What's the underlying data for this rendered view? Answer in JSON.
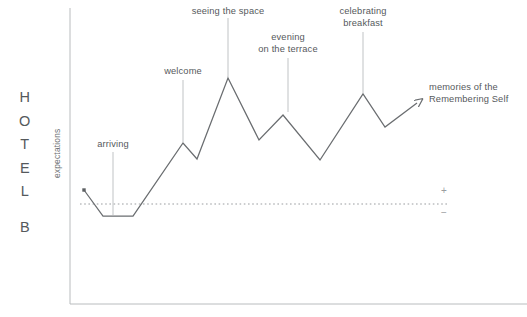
{
  "brand": {
    "name_top": "HOTEL",
    "name_bottom": "B",
    "letters": [
      "H",
      "O",
      "T",
      "E",
      "L"
    ],
    "second_word": "B"
  },
  "axes": {
    "y_label": "expectations",
    "positive_marker": "+",
    "negative_marker": "−"
  },
  "annotations": [
    {
      "id": "arriving",
      "label": "arriving"
    },
    {
      "id": "welcome",
      "label": "welcome"
    },
    {
      "id": "seeing-the-space",
      "label": "seeing the space"
    },
    {
      "id": "evening-on-the-terrace-1",
      "label": "evening"
    },
    {
      "id": "evening-on-the-terrace-2",
      "label": "on the terrace"
    },
    {
      "id": "celebrating-1",
      "label": "celebrating"
    },
    {
      "id": "celebrating-2",
      "label": "breakfast"
    },
    {
      "id": "memories-1",
      "label": "memories of the"
    },
    {
      "id": "memories-2",
      "label": "Remembering Self"
    }
  ],
  "colors": {
    "line": "#6a6d70",
    "axis": "#b9bcbe",
    "baseline": "#9a9da0",
    "text": "#56595c",
    "brand_text": "#55595c",
    "background": "#ffffff"
  },
  "chart_data": {
    "type": "line",
    "title": "",
    "subtitle": "",
    "xlabel": "",
    "ylabel": "expectations",
    "grid": false,
    "legend": false,
    "xlim": [
      70,
      527
    ],
    "ylim": [
      304,
      8
    ],
    "baseline_y": 204,
    "baseline_label_positive": "+",
    "baseline_label_negative": "−",
    "series": [
      {
        "name": "guest experience curve",
        "start_marker": "square-dot",
        "end_marker": "arrow",
        "points": [
          {
            "x": 84,
            "y": 190,
            "label": "start"
          },
          {
            "x": 103,
            "y": 216,
            "label": ""
          },
          {
            "x": 133,
            "y": 216,
            "label": ""
          },
          {
            "x": 183,
            "y": 143,
            "label": "welcome"
          },
          {
            "x": 197,
            "y": 159,
            "label": ""
          },
          {
            "x": 228,
            "y": 78,
            "label": "seeing the space"
          },
          {
            "x": 259,
            "y": 140,
            "label": ""
          },
          {
            "x": 283,
            "y": 115,
            "label": "evening on the terrace"
          },
          {
            "x": 320,
            "y": 160,
            "label": ""
          },
          {
            "x": 363,
            "y": 94,
            "label": "celebrating breakfast"
          },
          {
            "x": 385,
            "y": 127,
            "label": ""
          },
          {
            "x": 417,
            "y": 103,
            "label": "memories of the Remembering Self"
          }
        ]
      }
    ],
    "leaders": [
      {
        "id": "arriving",
        "x": 113,
        "y_top": 152,
        "y_bottom": 215
      },
      {
        "id": "welcome",
        "x": 183,
        "y_top": 80,
        "y_bottom": 142
      },
      {
        "id": "seeing-the-space",
        "x": 228,
        "y_top": 18,
        "y_bottom": 77
      },
      {
        "id": "evening",
        "x": 288,
        "y_top": 58,
        "y_bottom": 112
      },
      {
        "id": "celebrating",
        "x": 363,
        "y_top": 32,
        "y_bottom": 93
      }
    ]
  }
}
